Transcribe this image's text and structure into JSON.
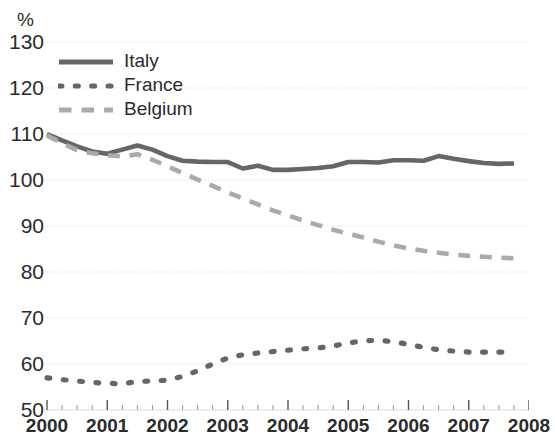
{
  "chart_data": {
    "type": "line",
    "title": "",
    "unit_label": "%",
    "xlabel": "",
    "ylabel": "%",
    "ylim": [
      50,
      130
    ],
    "xlim": [
      2000,
      2008
    ],
    "ytick_labels": [
      "130",
      "120",
      "110",
      "100",
      "90",
      "80",
      "70",
      "60",
      "50"
    ],
    "ytick_values": [
      130,
      120,
      110,
      100,
      90,
      80,
      70,
      60,
      50
    ],
    "xtick_labels": [
      "2000",
      "2001",
      "2002",
      "2003",
      "2004",
      "2005",
      "2006",
      "2007",
      "2008"
    ],
    "xtick_values": [
      2000,
      2001,
      2002,
      2003,
      2004,
      2005,
      2006,
      2007,
      2008
    ],
    "minor_ticks_per_year": 4,
    "grid": true,
    "legend_position": "top-left",
    "x": [
      2000.0,
      2000.25,
      2000.5,
      2000.75,
      2001.0,
      2001.25,
      2001.5,
      2001.75,
      2002.0,
      2002.25,
      2002.5,
      2002.75,
      2003.0,
      2003.25,
      2003.5,
      2003.75,
      2004.0,
      2004.25,
      2004.5,
      2004.75,
      2005.0,
      2005.25,
      2005.5,
      2005.75,
      2006.0,
      2006.25,
      2006.5,
      2006.75,
      2007.0,
      2007.25,
      2007.5,
      2007.75
    ],
    "series": [
      {
        "name": "Italy",
        "style": "solid",
        "color": "#666666",
        "values": [
          110.0,
          108.6,
          107.3,
          106.2,
          105.7,
          106.6,
          107.5,
          106.6,
          105.2,
          104.2,
          104.0,
          103.9,
          103.9,
          102.5,
          103.1,
          102.2,
          102.2,
          102.4,
          102.6,
          103.0,
          103.9,
          103.9,
          103.8,
          104.3,
          104.3,
          104.2,
          105.2,
          104.6,
          104.1,
          103.7,
          103.5,
          103.6
        ]
      },
      {
        "name": "France",
        "style": "dotted",
        "color": "#666666",
        "values": [
          57.0,
          56.6,
          56.3,
          56.0,
          55.8,
          55.7,
          56.2,
          56.3,
          56.5,
          57.3,
          58.5,
          60.0,
          61.3,
          62.0,
          62.4,
          62.7,
          63.0,
          63.3,
          63.5,
          63.9,
          64.6,
          65.0,
          65.2,
          64.8,
          64.3,
          63.6,
          63.1,
          62.8,
          62.6,
          62.6,
          62.6,
          62.6
        ]
      },
      {
        "name": "Belgium",
        "style": "dashed",
        "color": "#aaaaaa",
        "values": [
          109.7,
          108.0,
          106.5,
          105.8,
          105.4,
          105.1,
          105.6,
          104.4,
          103.0,
          101.5,
          100.1,
          98.7,
          97.3,
          96.0,
          94.7,
          93.4,
          92.3,
          91.2,
          90.2,
          89.2,
          88.3,
          87.5,
          86.6,
          85.8,
          85.1,
          84.6,
          84.2,
          83.8,
          83.5,
          83.3,
          83.1,
          83.0
        ]
      }
    ],
    "legend": [
      {
        "label": "Italy",
        "style": "solid",
        "color": "#666666"
      },
      {
        "label": "France",
        "style": "dotted",
        "color": "#666666"
      },
      {
        "label": "Belgium",
        "style": "dashed",
        "color": "#aaaaaa"
      }
    ],
    "colors": {
      "grid": "#e2e2e2",
      "axis": "#555555",
      "text": "#2b2b2b",
      "background": "#ffffff"
    }
  }
}
